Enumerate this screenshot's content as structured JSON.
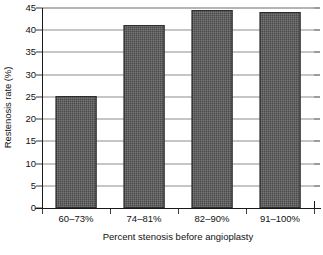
{
  "chart_data": {
    "type": "bar",
    "title": "",
    "subtitle": "",
    "categories": [
      "60–73%",
      "74–81%",
      "82–90%",
      "91–100%"
    ],
    "values": [
      25.3,
      41.2,
      44.6,
      44.0
    ],
    "series": [
      {
        "name": "Restenosis rate",
        "values": [
          25.3,
          41.2,
          44.6,
          44.0
        ]
      }
    ],
    "xlabel": "Percent stenosis before angioplasty",
    "ylabel": "Restenosis rate (%)",
    "ylim": [
      0,
      45
    ],
    "xlim_categories": 4,
    "ytick_labels": [
      "0",
      "5",
      "10",
      "15",
      "20",
      "25",
      "30",
      "35",
      "40",
      "45"
    ],
    "ytick_values": [
      0,
      5,
      10,
      15,
      20,
      25,
      30,
      35,
      40,
      45
    ],
    "ytick_step": 5,
    "grid": true,
    "grid_axis": "y",
    "legend": false,
    "legend_position": "none",
    "annotations": [],
    "colors": {
      "bar_fill": "#4a4a4a",
      "bar_edge": "#2e2e2e",
      "gridline": "#8d8d8d",
      "axis": "#1a1a1a",
      "text": "#111111",
      "background": "#ffffff"
    }
  }
}
